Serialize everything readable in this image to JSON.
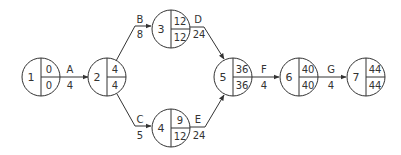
{
  "diagram": {
    "type": "activity-on-arrow network",
    "nodes": [
      {
        "id": "1",
        "top": "0",
        "bottom": "0"
      },
      {
        "id": "2",
        "top": "4",
        "bottom": "4"
      },
      {
        "id": "3",
        "top": "12",
        "bottom": "12"
      },
      {
        "id": "4",
        "top": "9",
        "bottom": "12"
      },
      {
        "id": "5",
        "top": "36",
        "bottom": "36"
      },
      {
        "id": "6",
        "top": "40",
        "bottom": "40"
      },
      {
        "id": "7",
        "top": "44",
        "bottom": "44"
      }
    ],
    "activities": [
      {
        "label": "A",
        "duration": "4",
        "from": "1",
        "to": "2"
      },
      {
        "label": "B",
        "duration": "8",
        "from": "2",
        "to": "3"
      },
      {
        "label": "C",
        "duration": "5",
        "from": "2",
        "to": "4"
      },
      {
        "label": "D",
        "duration": "24",
        "from": "3",
        "to": "5"
      },
      {
        "label": "E",
        "duration": "24",
        "from": "4",
        "to": "5"
      },
      {
        "label": "F",
        "duration": "4",
        "from": "5",
        "to": "6"
      },
      {
        "label": "G",
        "duration": "4",
        "from": "6",
        "to": "7"
      }
    ]
  }
}
